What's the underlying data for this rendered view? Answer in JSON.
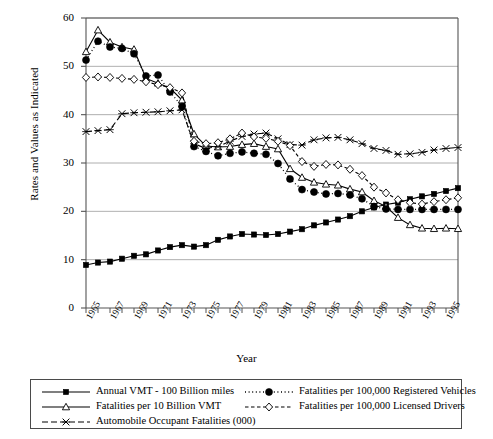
{
  "chart_data": {
    "type": "line",
    "title": "",
    "xlabel": "Year",
    "ylabel": "Rates and Values as Indicated",
    "xlim": [
      1965,
      1996
    ],
    "ylim": [
      0,
      60
    ],
    "yticks": [
      0,
      10,
      20,
      30,
      40,
      50,
      60
    ],
    "xticks": [
      1965,
      1967,
      1969,
      1971,
      1973,
      1975,
      1977,
      1979,
      1981,
      1983,
      1985,
      1987,
      1989,
      1991,
      1993,
      1995
    ],
    "grid": "horizontal",
    "legend_position": "below-axes",
    "x": [
      1965,
      1966,
      1967,
      1968,
      1969,
      1970,
      1971,
      1972,
      1973,
      1974,
      1975,
      1976,
      1977,
      1978,
      1979,
      1980,
      1981,
      1982,
      1983,
      1984,
      1985,
      1986,
      1987,
      1988,
      1989,
      1990,
      1991,
      1992,
      1993,
      1994,
      1995,
      1996
    ],
    "series": [
      {
        "name": "Annual VMT - 100 Billion miles",
        "marker": "filled-square",
        "linestyle": "solid",
        "values": [
          8.9,
          9.4,
          9.6,
          10.2,
          10.8,
          11.1,
          11.9,
          12.6,
          13.0,
          12.7,
          13.0,
          14.1,
          14.8,
          15.3,
          15.2,
          15.1,
          15.3,
          15.8,
          16.3,
          17.1,
          17.7,
          18.3,
          19.0,
          20.0,
          20.8,
          21.4,
          21.8,
          22.5,
          23.1,
          23.6,
          24.2,
          24.8
        ]
      },
      {
        "name": "Fatalities per 10 Billion VMT",
        "marker": "open-triangle",
        "linestyle": "solid",
        "values": [
          53.0,
          57.5,
          55.0,
          54.0,
          53.5,
          47.5,
          46.5,
          45.5,
          43.0,
          36.0,
          33.5,
          33.3,
          33.4,
          33.8,
          34.0,
          33.4,
          32.9,
          28.8,
          27.0,
          26.0,
          25.6,
          25.4,
          24.6,
          24.0,
          22.2,
          21.0,
          18.7,
          17.2,
          16.5,
          16.4,
          16.5,
          16.4
        ]
      },
      {
        "name": "Automobile Occupant Fatalities (000)",
        "marker": "x-cross",
        "linestyle": "long-dash",
        "values": [
          36.5,
          36.7,
          36.9,
          40.2,
          40.4,
          40.5,
          40.6,
          40.8,
          41.0,
          34.0,
          33.0,
          33.4,
          34.5,
          35.5,
          36.0,
          36.2,
          35.0,
          33.8,
          33.7,
          34.8,
          35.2,
          35.3,
          34.8,
          34.0,
          33.0,
          32.6,
          31.8,
          31.9,
          32.2,
          32.7,
          33.0,
          33.2
        ]
      },
      {
        "name": "Fatalities per 100,000 Registered Vehicles",
        "marker": "filled-circle",
        "linestyle": "dotted",
        "values": [
          51.3,
          55.2,
          54.0,
          53.7,
          52.6,
          48.0,
          48.2,
          44.7,
          41.7,
          33.4,
          32.4,
          31.5,
          32.0,
          32.3,
          32.0,
          31.8,
          29.9,
          26.7,
          24.5,
          24.0,
          23.6,
          23.7,
          23.4,
          22.6,
          21.0,
          20.5,
          20.4,
          20.4,
          20.4,
          20.4,
          20.4,
          20.4
        ]
      },
      {
        "name": "Fatalities per 100,000 Licensed Drivers",
        "marker": "open-diamond",
        "linestyle": "short-dash",
        "values": [
          47.7,
          47.8,
          47.7,
          47.5,
          47.3,
          46.8,
          46.2,
          45.6,
          44.5,
          34.5,
          34.0,
          34.2,
          35.0,
          36.2,
          35.4,
          35.1,
          34.5,
          33.6,
          30.3,
          29.3,
          29.7,
          29.6,
          28.7,
          27.4,
          25.0,
          23.8,
          22.4,
          21.8,
          21.5,
          22.0,
          22.4,
          22.8
        ]
      }
    ]
  },
  "legend": {
    "entries": [
      {
        "label": "Annual VMT - 100 Billion miles",
        "marker": "filled-square",
        "linestyle": "solid"
      },
      {
        "label": "Fatalities per 10 Billion VMT",
        "marker": "open-triangle",
        "linestyle": "solid"
      },
      {
        "label": "Automobile Occupant Fatalities (000)",
        "marker": "x-cross",
        "linestyle": "long-dash"
      },
      {
        "label": "Fatalities per 100,000 Registered Vehicles",
        "marker": "filled-circle",
        "linestyle": "dotted"
      },
      {
        "label": "Fatalities per 100,000 Licensed Drivers",
        "marker": "open-diamond",
        "linestyle": "short-dash"
      }
    ]
  },
  "colors": {
    "ink": "#000000",
    "grid": "#9a9a9a",
    "frame": "#555555",
    "background": "#ffffff"
  }
}
